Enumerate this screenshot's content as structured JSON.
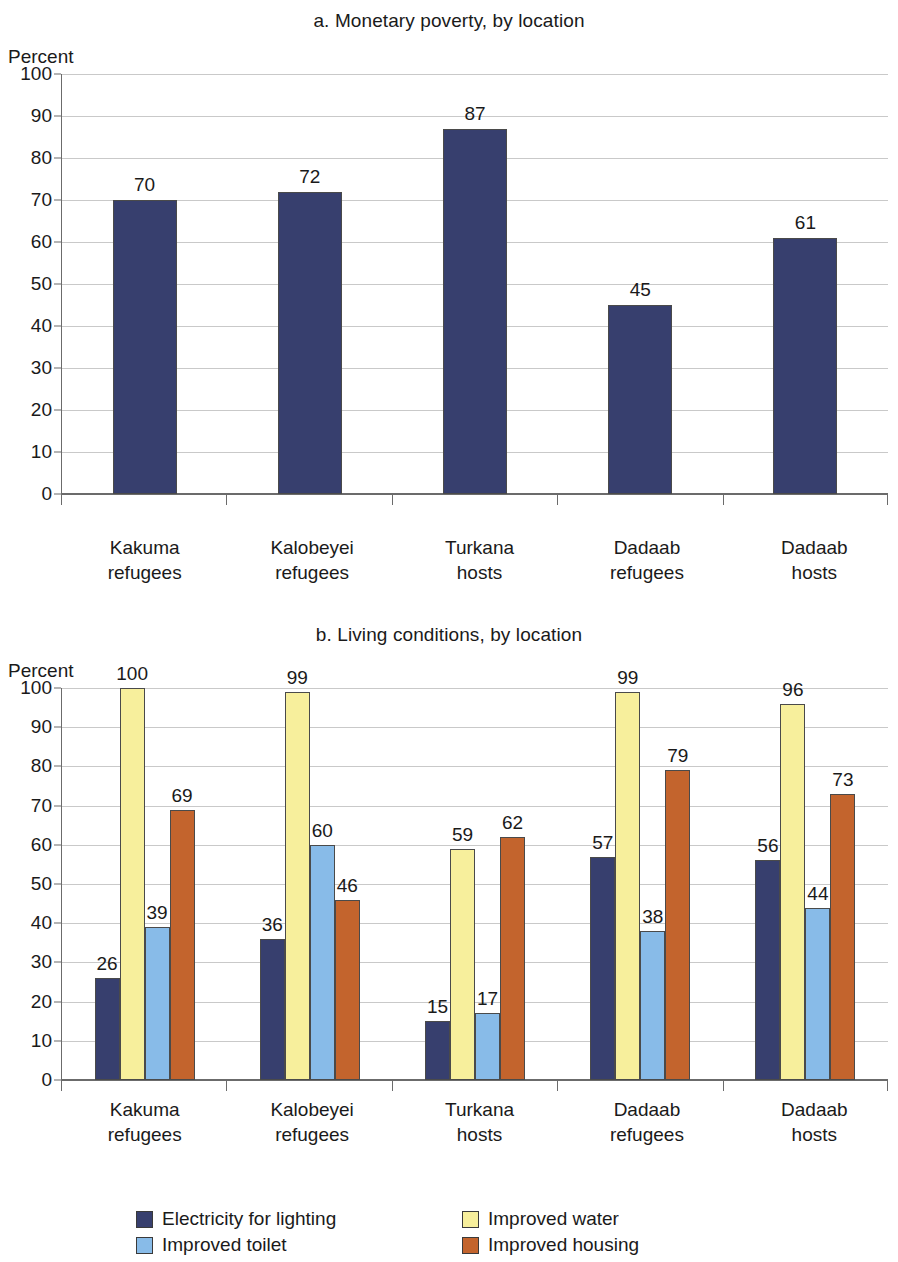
{
  "colors": {
    "navy": "#373f6e",
    "yellow": "#f7ef9c",
    "lightblue": "#88bbe8",
    "orange": "#c3642d",
    "gridline": "#c9c9c9",
    "axis": "#6b6b6b",
    "text": "#1a1a1a"
  },
  "panel_a": {
    "title": "a. Monetary poverty, by location",
    "unit": "Percent"
  },
  "panel_b": {
    "title": "b. Living conditions, by location",
    "unit": "Percent",
    "legend": [
      {
        "label": "Electricity for lighting",
        "color": "#373f6e"
      },
      {
        "label": "Improved water",
        "color": "#f7ef9c"
      },
      {
        "label": "Improved toilet",
        "color": "#88bbe8"
      },
      {
        "label": "Improved housing",
        "color": "#c3642d"
      }
    ]
  },
  "axis_ticks": [
    "100",
    "90",
    "80",
    "70",
    "60",
    "50",
    "40",
    "30",
    "20",
    "10",
    "0"
  ],
  "category_lines": [
    [
      "Kakuma",
      "refugees"
    ],
    [
      "Kalobeyei",
      "refugees"
    ],
    [
      "Turkana",
      "hosts"
    ],
    [
      "Dadaab",
      "refugees"
    ],
    [
      "Dadaab",
      "hosts"
    ]
  ],
  "chart_data": [
    {
      "type": "bar",
      "title": "a. Monetary poverty, by location",
      "xlabel": "",
      "ylabel": "Percent",
      "ylim": [
        0,
        100
      ],
      "yticks": [
        0,
        10,
        20,
        30,
        40,
        50,
        60,
        70,
        80,
        90,
        100
      ],
      "grid": true,
      "legend_position": "none",
      "categories": [
        "Kakuma refugees",
        "Kalobeyei refugees",
        "Turkana hosts",
        "Dadaab refugees",
        "Dadaab hosts"
      ],
      "values": [
        70,
        72,
        87,
        45,
        61
      ],
      "color": "#373f6e",
      "data_labels": [
        "70",
        "72",
        "87",
        "45",
        "61"
      ]
    },
    {
      "type": "bar",
      "title": "b. Living conditions, by location",
      "xlabel": "",
      "ylabel": "Percent",
      "ylim": [
        0,
        100
      ],
      "yticks": [
        0,
        10,
        20,
        30,
        40,
        50,
        60,
        70,
        80,
        90,
        100
      ],
      "grid": true,
      "legend_position": "bottom",
      "categories": [
        "Kakuma refugees",
        "Kalobeyei refugees",
        "Turkana hosts",
        "Dadaab refugees",
        "Dadaab hosts"
      ],
      "series": [
        {
          "name": "Electricity for lighting",
          "color": "#373f6e",
          "values": [
            26,
            36,
            15,
            57,
            56
          ]
        },
        {
          "name": "Improved water",
          "color": "#f7ef9c",
          "values": [
            100,
            99,
            59,
            99,
            96
          ]
        },
        {
          "name": "Improved toilet",
          "color": "#88bbe8",
          "values": [
            39,
            60,
            17,
            38,
            44
          ]
        },
        {
          "name": "Improved housing",
          "color": "#c3642d",
          "values": [
            69,
            46,
            62,
            79,
            73
          ]
        }
      ]
    }
  ]
}
